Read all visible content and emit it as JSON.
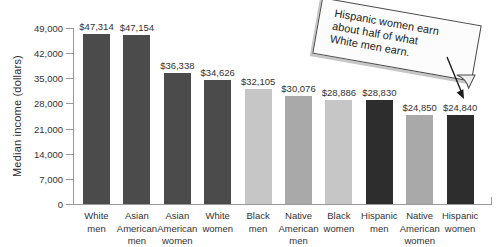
{
  "chart_data": {
    "type": "bar",
    "title": "",
    "xlabel": "",
    "ylabel": "Median income (dollars)",
    "ylim": [
      0,
      49000
    ],
    "grid": false,
    "legend": null,
    "ytick_values": [
      0,
      7000,
      14000,
      21000,
      28000,
      35000,
      42000,
      49000
    ],
    "ytick_labels": [
      "0",
      "7,000",
      "14,000",
      "21,000",
      "28,000",
      "35,000",
      "42,000",
      "49,000"
    ],
    "categories": [
      "White men",
      "Asian American men",
      "Asian American women",
      "White women",
      "Black men",
      "Native American men",
      "Black women",
      "Hispanic men",
      "Native American women",
      "Hispanic women"
    ],
    "category_label_lines": [
      [
        "White",
        "men"
      ],
      [
        "Asian",
        "American",
        "men"
      ],
      [
        "Asian",
        "American",
        "women"
      ],
      [
        "White",
        "women"
      ],
      [
        "Black",
        "men"
      ],
      [
        "Native",
        "American",
        "men"
      ],
      [
        "Black",
        "women"
      ],
      [
        "Hispanic",
        "men"
      ],
      [
        "Native",
        "American",
        "women"
      ],
      [
        "Hispanic",
        "women"
      ]
    ],
    "values": [
      47314,
      47154,
      36338,
      34626,
      32105,
      30076,
      28886,
      28830,
      24850,
      24840
    ],
    "value_labels": [
      "$47,314",
      "$47,154",
      "$36,338",
      "$34,626",
      "$32,105",
      "$30,076",
      "$28,886",
      "$28,830",
      "$24,850",
      "$24,840"
    ],
    "bar_colors": [
      "#4b4b4b",
      "#4b4b4b",
      "#4b4b4b",
      "#4b4b4b",
      "#c6c6c6",
      "#a9a9a9",
      "#c6c6c6",
      "#2d2d2d",
      "#a9a9a9",
      "#2d2d2d"
    ],
    "annotation": {
      "text": "Hispanic women earn about half of what White men earn.",
      "lines": [
        "Hispanic women earn",
        "about half of what",
        "White men earn."
      ],
      "points_to": "Hispanic women"
    }
  },
  "style": {
    "background": "#ffffff",
    "axis_color": "#9a9a9a",
    "text_color": "#333333",
    "arrow_color": "#1c1c1c",
    "note_background": "#fcfcfc",
    "note_border": "#4a4a4a"
  }
}
